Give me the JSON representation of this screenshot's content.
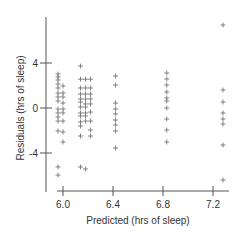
{
  "chart_data": {
    "type": "scatter",
    "title": "",
    "xlabel": "Predicted (hrs of sleep)",
    "ylabel": "Residuals (hrs of sleep)",
    "xlim": [
      5.94,
      7.34
    ],
    "ylim": [
      -7.5,
      8.0
    ],
    "x_ticks": [
      6.0,
      6.4,
      6.8,
      7.2
    ],
    "x_tick_labels": [
      "6.0",
      "6.4",
      "6.8",
      "7.2"
    ],
    "y_ticks": [
      4,
      0,
      -4
    ],
    "y_tick_labels": [
      "4",
      "0",
      "-4"
    ],
    "grid": false,
    "legend": null,
    "marker": "+",
    "marker_color": "#777777",
    "points": [
      [
        5.96,
        3.02
      ],
      [
        5.96,
        2.76
      ],
      [
        5.96,
        2.49
      ],
      [
        5.96,
        2.13
      ],
      [
        5.96,
        1.78
      ],
      [
        5.96,
        1.33
      ],
      [
        5.96,
        0.98
      ],
      [
        5.96,
        0.62
      ],
      [
        5.96,
        -0.09
      ],
      [
        5.96,
        -0.44
      ],
      [
        5.96,
        -0.8
      ],
      [
        5.96,
        -1.16
      ],
      [
        5.96,
        -2.04
      ],
      [
        5.96,
        -5.24
      ],
      [
        5.96,
        -5.96
      ],
      [
        6.0,
        1.96
      ],
      [
        6.0,
        1.33
      ],
      [
        6.0,
        0.98
      ],
      [
        6.0,
        0.44
      ],
      [
        6.0,
        -0.09
      ],
      [
        6.0,
        -0.44
      ],
      [
        6.0,
        -1.16
      ],
      [
        6.0,
        -2.13
      ],
      [
        6.0,
        -3.02
      ],
      [
        6.14,
        3.73
      ],
      [
        6.14,
        2.56
      ],
      [
        6.14,
        1.78
      ],
      [
        6.14,
        1.24
      ],
      [
        6.14,
        0.8
      ],
      [
        6.14,
        0.53
      ],
      [
        6.14,
        0.09
      ],
      [
        6.14,
        -0.44
      ],
      [
        6.14,
        -0.71
      ],
      [
        6.14,
        -1.24
      ],
      [
        6.14,
        -1.6
      ],
      [
        6.14,
        -2.49
      ],
      [
        6.14,
        -5.24
      ],
      [
        6.18,
        2.56
      ],
      [
        6.18,
        1.78
      ],
      [
        6.18,
        1.24
      ],
      [
        6.18,
        0.8
      ],
      [
        6.18,
        0.36
      ],
      [
        6.18,
        0.09
      ],
      [
        6.18,
        -0.44
      ],
      [
        6.18,
        -0.71
      ],
      [
        6.18,
        -1.16
      ],
      [
        6.18,
        -5.42
      ],
      [
        6.22,
        2.56
      ],
      [
        6.22,
        1.78
      ],
      [
        6.22,
        1.24
      ],
      [
        6.22,
        0.8
      ],
      [
        6.22,
        0.36
      ],
      [
        6.22,
        -0.36
      ],
      [
        6.22,
        -1.16
      ],
      [
        6.22,
        -1.96
      ],
      [
        6.22,
        -2.49
      ],
      [
        6.42,
        2.84
      ],
      [
        6.42,
        2.04
      ],
      [
        6.42,
        0.44
      ],
      [
        6.42,
        -0.09
      ],
      [
        6.42,
        -0.53
      ],
      [
        6.42,
        -1.07
      ],
      [
        6.42,
        -1.51
      ],
      [
        6.42,
        -2.04
      ],
      [
        6.42,
        -3.56
      ],
      [
        6.83,
        3.11
      ],
      [
        6.83,
        2.58
      ],
      [
        6.83,
        2.04
      ],
      [
        6.83,
        1.42
      ],
      [
        6.83,
        0.89
      ],
      [
        6.83,
        0.62
      ],
      [
        6.83,
        0.0
      ],
      [
        6.83,
        -0.98
      ],
      [
        6.83,
        -1.96
      ],
      [
        6.83,
        -3.02
      ],
      [
        7.28,
        7.38
      ],
      [
        7.28,
        1.6
      ],
      [
        7.28,
        0.53
      ],
      [
        7.28,
        -0.44
      ],
      [
        7.28,
        -0.98
      ],
      [
        7.28,
        -1.42
      ],
      [
        7.28,
        -3.29
      ],
      [
        7.28,
        -6.4
      ]
    ]
  }
}
